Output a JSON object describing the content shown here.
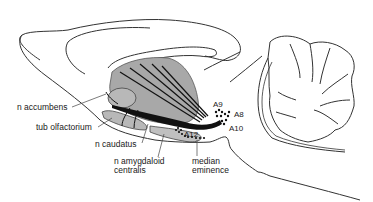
{
  "diagram": {
    "type": "sagittal brain section – dopaminergic pathways",
    "colors": {
      "outline": "#333333",
      "striatum_fill": "#a8a8a8",
      "pathway": "#111111",
      "background": "#ffffff"
    },
    "labels": {
      "n_accumbens": "n accumbens",
      "tub_olfactorium": "tub olfactorium",
      "n_caudatus": "n caudatus",
      "n_amygdaloid_line1": "n amygdaloid",
      "n_amygdaloid_line2": "centralis",
      "median_line1": "median",
      "median_line2": "eminence",
      "a9": "A9",
      "a8": "A8",
      "a10": "A10",
      "a12": "A12"
    }
  }
}
